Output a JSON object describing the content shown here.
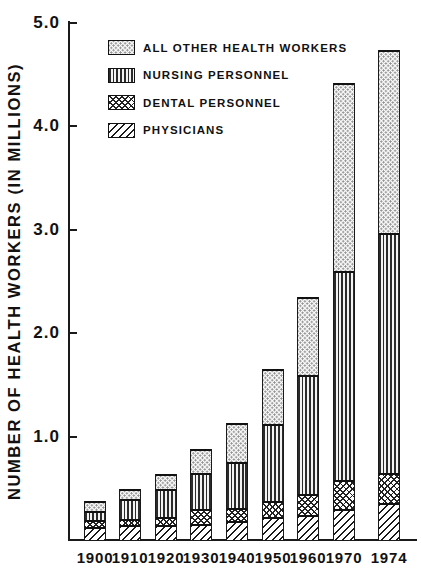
{
  "chart_data": {
    "type": "bar",
    "stacked": true,
    "title": "",
    "xlabel": "",
    "ylabel": "NUMBER OF HEALTH WORKERS (IN MILLIONS)",
    "units": "millions of workers",
    "categories": [
      "1900",
      "1910",
      "1920",
      "1930",
      "1940",
      "1950",
      "1960",
      "1970",
      "1974"
    ],
    "series": [
      {
        "name": "PHYSICIANS",
        "pattern": "diagonal-stripes",
        "values": [
          0.125,
          0.14,
          0.145,
          0.155,
          0.18,
          0.22,
          0.24,
          0.3,
          0.355
        ]
      },
      {
        "name": "DENTAL PERSONNEL",
        "pattern": "crosshatch",
        "values": [
          0.065,
          0.065,
          0.08,
          0.14,
          0.13,
          0.16,
          0.2,
          0.28,
          0.295
        ]
      },
      {
        "name": "NURSING PERSONNEL",
        "pattern": "vertical-stripes",
        "values": [
          0.095,
          0.195,
          0.265,
          0.355,
          0.44,
          0.74,
          1.15,
          2.02,
          2.32
        ]
      },
      {
        "name": "ALL OTHER HEALTH WORKERS",
        "pattern": "stipple-dots",
        "values": [
          0.09,
          0.09,
          0.15,
          0.225,
          0.38,
          0.53,
          0.755,
          1.82,
          1.76
        ]
      }
    ],
    "totals": [
      0.375,
      0.49,
      0.64,
      0.875,
      1.13,
      1.65,
      2.345,
      4.42,
      4.73
    ],
    "ylim": [
      0,
      5.0
    ],
    "yticks": [
      {
        "value": 1.0,
        "label": "1.0"
      },
      {
        "value": 2.0,
        "label": "2.0"
      },
      {
        "value": 3.0,
        "label": "3.0"
      },
      {
        "value": 4.0,
        "label": "4.0"
      },
      {
        "value": 5.0,
        "label": "5.0"
      }
    ],
    "legend_order": [
      "ALL OTHER HEALTH WORKERS",
      "NURSING PERSONNEL",
      "DENTAL PERSONNEL",
      "PHYSICIANS"
    ],
    "legend_position": "top-left",
    "grid": false,
    "colors": {
      "ink": "#1a1a1a",
      "background": "#ffffff"
    }
  }
}
